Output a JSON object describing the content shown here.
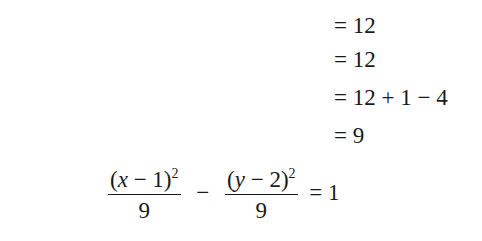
{
  "equations": [
    {
      "lhs_html": "<i>x</i><sup>2</sup> − 2<i>x</i> − <i>y</i><sup>2</sup> + 4<i>y</i>",
      "lhs": "x^2 − 2x − y^2 + 4y",
      "rhs": "= 12"
    },
    {
      "lhs_html": "<i>x</i><sup>2</sup> − 2<i>x</i> − (<i>y</i><sup>2</sup> − 4<i>y</i>)",
      "lhs": "x^2 − 2x − (y^2 − 4y)",
      "rhs": "= 12"
    },
    {
      "lhs_html": "<i>x</i><sup>2</sup> − 2<i>x</i> + 1 − (<i>y</i><sup>2</sup> − 4<i>y</i> + 4)",
      "lhs": "x^2 − 2x + 1 − (y^2 − 4y + 4)",
      "rhs": "= 12 + 1 − 4"
    },
    {
      "lhs_html": "(<i>x</i> − 1)<sup>2</sup> − (<i>y</i> − 2)<sup>2</sup>",
      "lhs": "(x − 1)^2 − (y − 2)^2",
      "rhs": "= 9"
    }
  ],
  "final": {
    "frac1_num": "(x − 1)^2",
    "frac1_den": "9",
    "operator": "−",
    "frac2_num": "(y − 2)^2",
    "frac2_den": "9",
    "rhs": "= 1"
  }
}
